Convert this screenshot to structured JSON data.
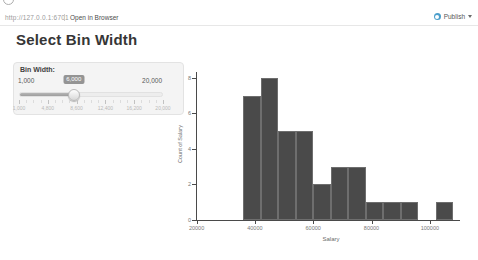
{
  "toolbar": {
    "url": "http://127.0.0.1:6701",
    "open_in_browser": "Open in Browser",
    "publish_label": "Publish"
  },
  "title": "Select Bin Width",
  "slider": {
    "label": "Bin Width:",
    "min_label": "1,000",
    "max_label": "20,000",
    "value_label": "6,000",
    "percent": 38,
    "grid_labels": [
      "1,000",
      "4,800",
      "8,600",
      "12,400",
      "16,200",
      "20,000"
    ]
  },
  "colors": {
    "publish_icon": "#4a9ecb",
    "bar": "#4a4a4a",
    "bar_border": "#6e6e6e"
  },
  "chart_data": {
    "type": "bar",
    "title": "",
    "xlabel": "Salary",
    "ylabel": "Count of Salary",
    "bin_start": 36000,
    "bin_width": 6000,
    "counts": [
      7,
      8,
      5,
      5,
      2,
      3,
      3,
      1,
      1,
      1,
      0,
      1
    ],
    "x_ticks": [
      20000,
      40000,
      60000,
      80000,
      100000
    ],
    "y_ticks": [
      0,
      2,
      4,
      6,
      8
    ],
    "xlim": [
      19800,
      112400
    ],
    "ylim": [
      0,
      8.55
    ],
    "grid": false,
    "legend": false
  }
}
